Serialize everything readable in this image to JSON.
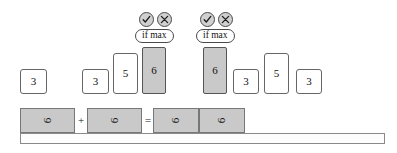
{
  "diagram": {
    "colors": {
      "highlight_fill": "#c9c9c9",
      "box_border": "#666666",
      "rail_border": "#8a8a8a",
      "background": "#ffffff",
      "text": "#111111"
    },
    "value_boxes": [
      {
        "label": "3",
        "value": 3,
        "highlighted": false,
        "x": 20,
        "y": 69,
        "w": 27,
        "h": 25
      },
      {
        "label": "3",
        "value": 3,
        "highlighted": false,
        "x": 82,
        "y": 69,
        "w": 27,
        "h": 25
      },
      {
        "label": "5",
        "value": 5,
        "highlighted": false,
        "x": 113,
        "y": 53,
        "w": 25,
        "h": 41
      },
      {
        "label": "6",
        "value": 6,
        "highlighted": true,
        "x": 142,
        "y": 47,
        "w": 24,
        "h": 47
      },
      {
        "label": "6",
        "value": 6,
        "highlighted": true,
        "x": 203,
        "y": 47,
        "w": 24,
        "h": 47
      },
      {
        "label": "3",
        "value": 3,
        "highlighted": false,
        "x": 233,
        "y": 69,
        "w": 26,
        "h": 25
      },
      {
        "label": "5",
        "value": 5,
        "highlighted": false,
        "x": 264,
        "y": 53,
        "w": 25,
        "h": 41
      },
      {
        "label": "3",
        "value": 3,
        "highlighted": false,
        "x": 296,
        "y": 69,
        "w": 26,
        "h": 25
      }
    ],
    "annotations": [
      {
        "x": 135,
        "y": 12,
        "accept_icon": "check-circle-icon",
        "reject_icon": "x-circle-icon",
        "condition_label": "if max"
      },
      {
        "x": 196,
        "y": 12,
        "accept_icon": "check-circle-icon",
        "reject_icon": "x-circle-icon",
        "condition_label": "if max"
      }
    ],
    "equation": {
      "boxes": [
        {
          "glyph": "6",
          "x": 20,
          "y": 108,
          "w": 55,
          "h": 25
        },
        {
          "glyph": "6",
          "x": 87,
          "y": 108,
          "w": 55,
          "h": 25
        },
        {
          "glyph": "6",
          "x": 153,
          "y": 108,
          "w": 46,
          "h": 25
        },
        {
          "glyph": "6",
          "x": 199,
          "y": 108,
          "w": 46,
          "h": 25
        }
      ],
      "operators": [
        {
          "symbol": "+",
          "x": 75,
          "y": 114
        },
        {
          "symbol": "=",
          "x": 142,
          "y": 114
        }
      ],
      "rail": {
        "x": 20,
        "y": 133,
        "w": 365,
        "h": 11
      }
    }
  }
}
